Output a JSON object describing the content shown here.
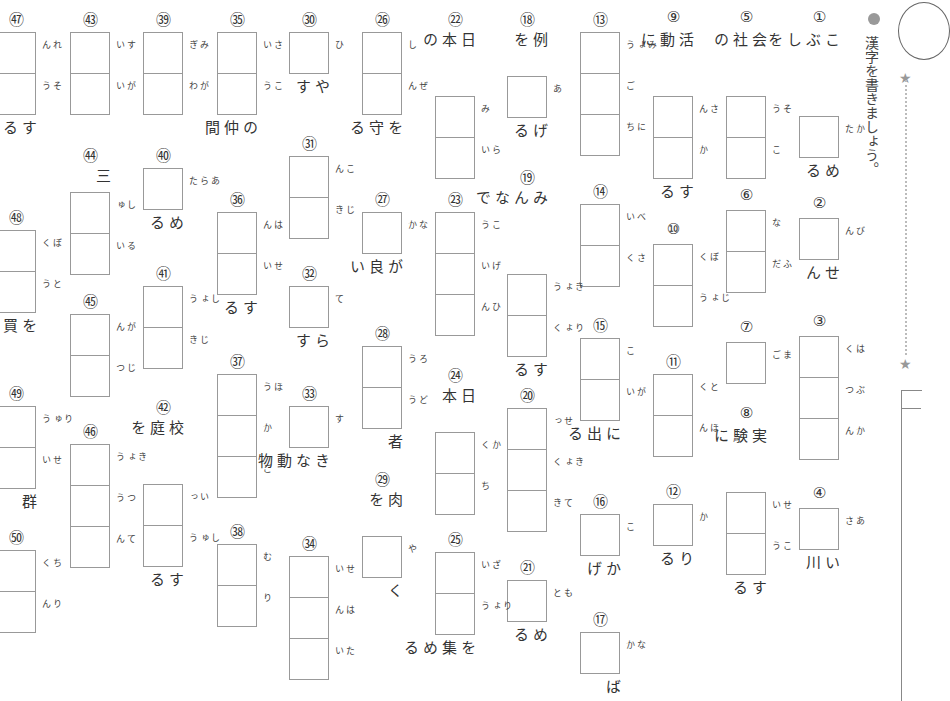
{
  "instruction": "漢字を書きましょう。",
  "items": [
    {
      "num": "①",
      "pre": "こぶしを",
      "furi": [
        "かた"
      ],
      "post": "める",
      "x": 799,
      "y": 8
    },
    {
      "num": "②",
      "pre": "",
      "furi": [
        "びん"
      ],
      "post": "せん",
      "x": 799,
      "y": 194
    },
    {
      "num": "③",
      "pre": "",
      "furi": [
        "はく",
        "ぶつ",
        "かん"
      ],
      "post": "",
      "x": 799,
      "y": 312
    },
    {
      "num": "④",
      "pre": "",
      "furi": [
        "あさ"
      ],
      "post": "い川",
      "x": 799,
      "y": 484
    },
    {
      "num": "⑤",
      "pre": "会社の",
      "furi": [
        "そう",
        "こ"
      ],
      "post": "",
      "x": 726,
      "y": 8
    },
    {
      "num": "⑥",
      "pre": "",
      "furi": [
        "な",
        "ふだ"
      ],
      "post": "",
      "x": 726,
      "y": 186
    },
    {
      "num": "⑦",
      "pre": "",
      "furi": [
        "まご"
      ],
      "post": "",
      "x": 726,
      "y": 318
    },
    {
      "num": "⑧",
      "pre": "実験に",
      "furi": [
        "せい",
        "こう"
      ],
      "post": "する",
      "x": 726,
      "y": 404
    },
    {
      "num": "⑨",
      "pre": "活動に",
      "furi": [
        "さん",
        "か"
      ],
      "post": "する",
      "x": 653,
      "y": 8
    },
    {
      "num": "⑩",
      "pre": "",
      "furi": [
        "ぼく",
        "じょう"
      ],
      "post": "",
      "x": 653,
      "y": 220
    },
    {
      "num": "⑪",
      "pre": "",
      "furi": [
        "とく",
        "ほん"
      ],
      "post": "",
      "x": 653,
      "y": 350
    },
    {
      "num": "⑫",
      "pre": "",
      "furi": [
        "か"
      ],
      "post": "りる",
      "x": 653,
      "y": 480
    },
    {
      "num": "⑬",
      "pre": "",
      "furi": [
        "みょう",
        "ご",
        "にち"
      ],
      "post": "",
      "x": 580,
      "y": 8
    },
    {
      "num": "⑭",
      "pre": "",
      "furi": [
        "べい",
        "さく"
      ],
      "post": "",
      "x": 580,
      "y": 180
    },
    {
      "num": "⑮",
      "pre": "",
      "furi": [
        "こ",
        "がい"
      ],
      "post": "に出る",
      "x": 580,
      "y": 314
    },
    {
      "num": "⑯",
      "pre": "",
      "furi": [
        "こ"
      ],
      "post": "かげ",
      "x": 580,
      "y": 490
    },
    {
      "num": "⑰",
      "pre": "",
      "furi": [
        "なか"
      ],
      "post": "ば",
      "x": 580,
      "y": 608
    },
    {
      "num": "⑱",
      "pre": "例を",
      "furi": [
        "あ"
      ],
      "post": "げる",
      "x": 507,
      "y": 8
    },
    {
      "num": "⑲",
      "pre": "みんなで",
      "furi": [
        "きょう",
        "りょく"
      ],
      "post": "する",
      "x": 507,
      "y": 166
    },
    {
      "num": "⑳",
      "pre": "",
      "furi": [
        "せっ",
        "きょく",
        "てき"
      ],
      "post": "",
      "x": 507,
      "y": 384
    },
    {
      "num": "㉑",
      "pre": "",
      "furi": [
        "もと"
      ],
      "post": "める",
      "x": 507,
      "y": 556
    },
    {
      "num": "㉒",
      "pre": "日本の",
      "furi": [
        "み",
        "らい"
      ],
      "post": "",
      "x": 435,
      "y": 8
    },
    {
      "num": "㉓",
      "pre": "",
      "furi": [
        "こう",
        "げい",
        "ひん"
      ],
      "post": "",
      "x": 435,
      "y": 188
    },
    {
      "num": "㉔",
      "pre": "日本",
      "furi": [
        "かく",
        "ち"
      ],
      "post": "",
      "x": 435,
      "y": 364
    },
    {
      "num": "㉕",
      "pre": "",
      "furi": [
        "ざい",
        "りょう"
      ],
      "post": "を集める",
      "x": 435,
      "y": 528
    },
    {
      "num": "㉖",
      "pre": "",
      "furi": [
        "し",
        "ぜん"
      ],
      "post": "を守る",
      "x": 362,
      "y": 8
    },
    {
      "num": "㉗",
      "pre": "",
      "furi": [
        "なか"
      ],
      "post": "が良い",
      "x": 362,
      "y": 188
    },
    {
      "num": "㉘",
      "pre": "",
      "furi": [
        "ろう",
        "どう"
      ],
      "post": "者",
      "x": 362,
      "y": 322
    },
    {
      "num": "㉙",
      "pre": "肉を",
      "furi": [
        "や"
      ],
      "post": "く",
      "x": 362,
      "y": 468
    },
    {
      "num": "㉚",
      "pre": "",
      "furi": [
        "ひ"
      ],
      "post": "やす",
      "x": 289,
      "y": 8
    },
    {
      "num": "㉛",
      "pre": "",
      "furi": [
        "こん",
        "じき"
      ],
      "post": "",
      "x": 289,
      "y": 132
    },
    {
      "num": "㉜",
      "pre": "",
      "furi": [
        "て"
      ],
      "post": "らす",
      "x": 289,
      "y": 262
    },
    {
      "num": "㉝",
      "pre": "",
      "furi": [
        "す"
      ],
      "post": "きな動物",
      "x": 289,
      "y": 382
    },
    {
      "num": "㉞",
      "pre": "",
      "furi": [
        "せい",
        "はん",
        "たい"
      ],
      "post": "",
      "x": 289,
      "y": 532
    },
    {
      "num": "㉟",
      "pre": "",
      "furi": [
        "さい",
        "こう"
      ],
      "post": "の仲間",
      "x": 217,
      "y": 8
    },
    {
      "num": "㊱",
      "pre": "",
      "furi": [
        "はん",
        "せい"
      ],
      "post": "する",
      "x": 217,
      "y": 188
    },
    {
      "num": "㊲",
      "pre": "",
      "furi": [
        "ほう",
        "か",
        "ご"
      ],
      "post": "",
      "x": 217,
      "y": 350
    },
    {
      "num": "㊳",
      "pre": "",
      "furi": [
        "む",
        "り"
      ],
      "post": "",
      "x": 217,
      "y": 520
    },
    {
      "num": "㊴",
      "pre": "",
      "furi": [
        "みぎ",
        "がわ"
      ],
      "post": "",
      "x": 143,
      "y": 8
    },
    {
      "num": "㊵",
      "pre": "",
      "furi": [
        "あらた"
      ],
      "post": "める",
      "x": 143,
      "y": 144
    },
    {
      "num": "㊶",
      "pre": "",
      "furi": [
        "しょう",
        "じき"
      ],
      "post": "",
      "x": 143,
      "y": 262
    },
    {
      "num": "㊷",
      "pre": "校庭を",
      "furi": [
        "いっ",
        "しゅう"
      ],
      "post": "する",
      "x": 143,
      "y": 396
    },
    {
      "num": "㊸",
      "pre": "",
      "furi": [
        "すい",
        "がい"
      ],
      "post": "",
      "x": 70,
      "y": 8
    },
    {
      "num": "㊹",
      "pre": "三",
      "furi": [
        "しゅ",
        "るい"
      ],
      "post": "",
      "x": 70,
      "y": 144
    },
    {
      "num": "㊺",
      "pre": "",
      "furi": [
        "がん",
        "じつ"
      ],
      "post": "",
      "x": 70,
      "y": 290
    },
    {
      "num": "㊻",
      "pre": "",
      "furi": [
        "きょう",
        "つう",
        "てん"
      ],
      "post": "",
      "x": 70,
      "y": 420
    },
    {
      "num": "㊼",
      "pre": "",
      "furi": [
        "れん",
        "そう"
      ],
      "post": "する言葉",
      "x": -4,
      "y": 8
    },
    {
      "num": "㊽",
      "pre": "",
      "furi": [
        "ぼく",
        "とう"
      ],
      "post": "を買う",
      "x": -4,
      "y": 206
    },
    {
      "num": "㊾",
      "pre": "",
      "furi": [
        "りゅう",
        "せい"
      ],
      "post": "群",
      "x": -4,
      "y": 382
    },
    {
      "num": "㊿",
      "pre": "",
      "furi": [
        "ちく",
        "りん"
      ],
      "post": "",
      "x": -4,
      "y": 526
    }
  ]
}
